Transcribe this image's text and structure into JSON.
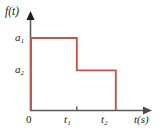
{
  "figure": {
    "background": "#ffffff",
    "axis_color": "#5a5a5a",
    "curve_color": "#c0564a",
    "text_color": "#1a1a1a"
  },
  "labels": {
    "y_axis": "f(t)",
    "x_axis_var": "t(s)",
    "origin": "0",
    "a1_base": "a",
    "a1_sub": "1",
    "a2_base": "a",
    "a2_sub": "2",
    "t1_base": "t",
    "t1_sub": "1",
    "t2_base": "t",
    "t2_sub": "2"
  },
  "chart_data": {
    "type": "line",
    "title": "",
    "xlabel": "t(s)",
    "ylabel": "f(t)",
    "grid": false,
    "legend": null,
    "xlim": [
      0,
      1.32
    ],
    "ylim": [
      0,
      1.18
    ],
    "x_ticks": [
      {
        "value": 0,
        "label": "0"
      },
      {
        "value": 0.54,
        "label": "t1"
      },
      {
        "value": 1.0,
        "label": "t2"
      }
    ],
    "y_ticks": [
      {
        "value": 0.55,
        "label": "a2"
      },
      {
        "value": 1.0,
        "label": "a1"
      }
    ],
    "series": [
      {
        "name": "f(t)",
        "color": "#c0564a",
        "x": [
          0,
          0,
          0.54,
          0.54,
          1.0,
          1.0
        ],
        "values": [
          0,
          1.0,
          1.0,
          0.55,
          0.55,
          0
        ]
      }
    ],
    "segments": [
      {
        "from_x": 0,
        "to_x": 0.54,
        "level_label": "a1",
        "level": 1.0
      },
      {
        "from_x": 0.54,
        "to_x": 1.0,
        "level_label": "a2",
        "level": 0.55
      },
      {
        "from_x": 1.0,
        "to_x": 1.32,
        "level_label": "0",
        "level": 0
      }
    ]
  }
}
